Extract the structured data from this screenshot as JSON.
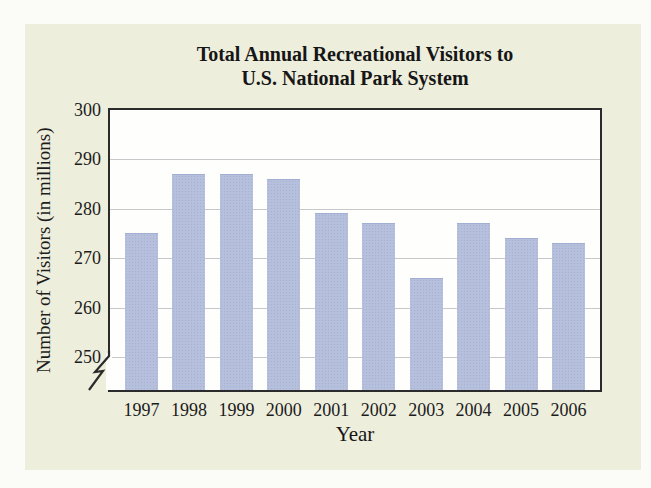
{
  "page": {
    "background": "#fbfbf8",
    "card_background": "#eeeedd"
  },
  "chart_data": {
    "type": "bar",
    "title_line1": "Total Annual Recreational Visitors to",
    "title_line2": "U.S. National Park System",
    "xlabel": "Year",
    "ylabel": "Number of Visitors (in millions)",
    "categories": [
      "1997",
      "1998",
      "1999",
      "2000",
      "2001",
      "2002",
      "2003",
      "2004",
      "2005",
      "2006"
    ],
    "values": [
      275,
      287,
      287,
      286,
      279,
      277,
      266,
      277,
      274,
      273
    ],
    "y_ticks": [
      250,
      260,
      270,
      280,
      290,
      300
    ],
    "ylim_visible": [
      250,
      300
    ],
    "axis_break": true,
    "grid": true,
    "legend": "none",
    "bar_color": "#b6c0dd",
    "grid_color": "#c6c8ca",
    "frame_color": "#2b2b2b",
    "title_color": "#161616"
  }
}
